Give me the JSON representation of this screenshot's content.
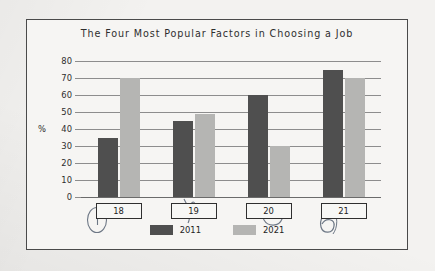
{
  "figure": {
    "title": "The Four Most Popular Factors in Choosing a Job",
    "y_unit_label": "%"
  },
  "legend": {
    "items": [
      {
        "label": "2011",
        "color": "#4f4f4f"
      },
      {
        "label": "2021",
        "color": "#b5b5b3"
      }
    ]
  },
  "axis": {
    "y_ticks": [
      "80",
      "70",
      "60",
      "50",
      "40",
      "30",
      "20",
      "10",
      "0"
    ],
    "x_categories": [
      "18",
      "19",
      "20",
      "21"
    ]
  },
  "annotations": {
    "mark_1": "1",
    "mark_2": "4",
    "mark_3": "3",
    "mark_4": "6"
  },
  "chart_data": {
    "type": "bar",
    "title": "The Four Most Popular Factors in Choosing a Job",
    "xlabel": "",
    "ylabel": "%",
    "ylim": [
      0,
      80
    ],
    "ytick_step": 10,
    "grid": true,
    "legend_position": "bottom",
    "categories": [
      "18",
      "19",
      "20",
      "21"
    ],
    "series": [
      {
        "name": "2011",
        "color": "#4f4f4f",
        "values": [
          35,
          45,
          60,
          75
        ]
      },
      {
        "name": "2021",
        "color": "#b5b5b3",
        "values": [
          70,
          49,
          30,
          70
        ]
      }
    ]
  }
}
